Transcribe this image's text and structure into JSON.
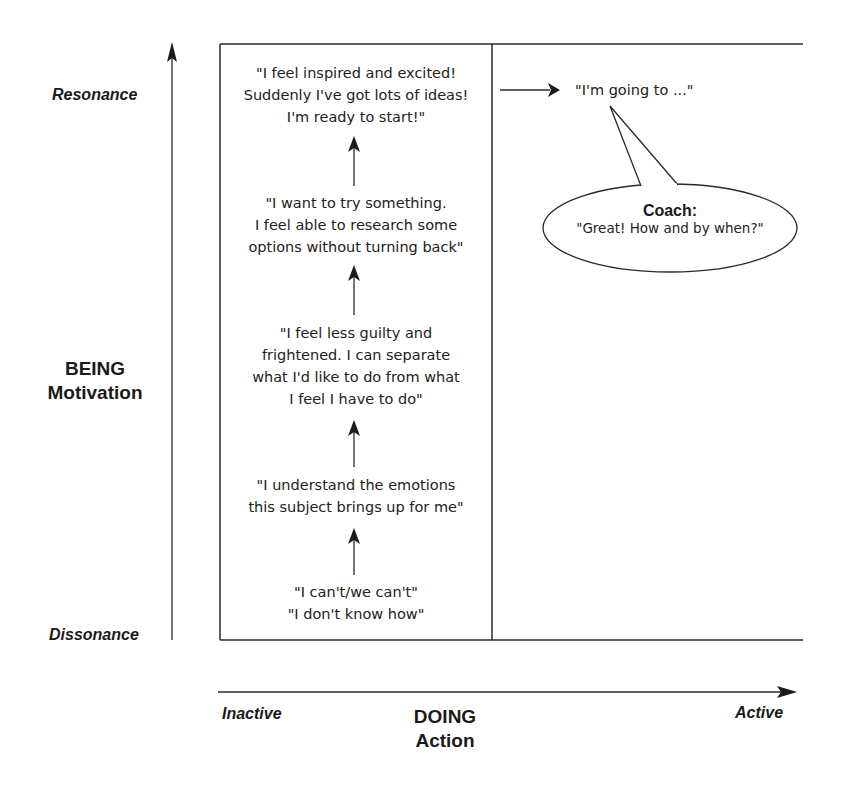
{
  "y_axis": {
    "top_label": "Resonance",
    "bottom_label": "Dissonance",
    "title_line1": "BEING",
    "title_line2": "Motivation"
  },
  "x_axis": {
    "left_label": "Inactive",
    "right_label": "Active",
    "title_line1": "DOING",
    "title_line2": "Action"
  },
  "stages": [
    {
      "lines": [
        "\"I feel inspired and excited!",
        "Suddenly I've got lots of ideas!",
        "I'm ready to start!\""
      ]
    },
    {
      "lines": [
        "\"I want to try something.",
        "I feel able to research some",
        "options without turning back\""
      ]
    },
    {
      "lines": [
        "\"I feel less guilty and",
        "frightened. I can separate",
        "what I'd like to do from what",
        "I feel I have to do\""
      ]
    },
    {
      "lines": [
        "\"I understand the emotions",
        "this subject brings up for me\""
      ]
    },
    {
      "lines": [
        "\"I can't/we can't\"",
        "\"I don't know how\""
      ]
    }
  ],
  "action": {
    "statement": "\"I'm going to ...\""
  },
  "coach_bubble": {
    "title": "Coach:",
    "text": "\"Great! How and by when?\""
  },
  "colors": {
    "line": "#2a2a2a",
    "text": "#1a1a1a",
    "background": "#ffffff"
  }
}
